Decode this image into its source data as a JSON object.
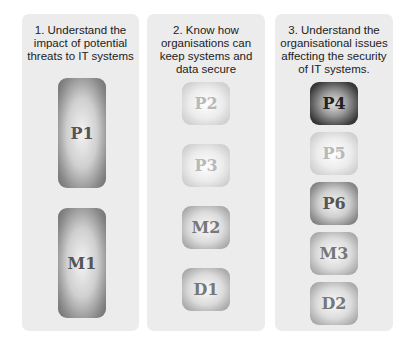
{
  "columns": [
    {
      "title": "1. Understand the impact of potential threats to IT systems",
      "criteria": [
        {
          "label": "P1",
          "shade": "dark"
        },
        {
          "label": "M1",
          "shade": "dark"
        }
      ]
    },
    {
      "title": "2. Know how organisations can keep systems and data secure",
      "criteria": [
        {
          "label": "P2",
          "shade": "light"
        },
        {
          "label": "P3",
          "shade": "light"
        },
        {
          "label": "M2",
          "shade": "med"
        },
        {
          "label": "D1",
          "shade": "med"
        }
      ]
    },
    {
      "title": "3. Understand the organisational issues affecting the security of IT systems.",
      "criteria": [
        {
          "label": "P4",
          "shade": "black"
        },
        {
          "label": "P5",
          "shade": "light"
        },
        {
          "label": "P6",
          "shade": "dark"
        },
        {
          "label": "M3",
          "shade": "med"
        },
        {
          "label": "D2",
          "shade": "med"
        }
      ]
    }
  ]
}
